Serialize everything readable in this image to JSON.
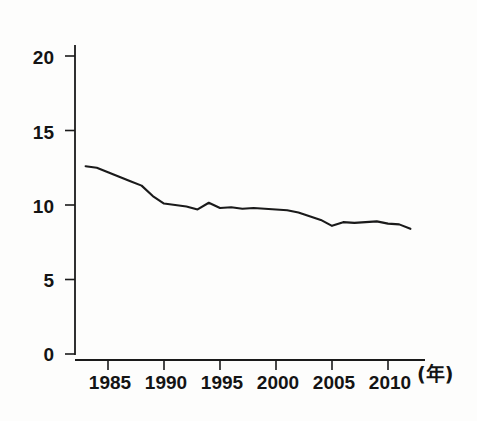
{
  "chart_data": {
    "type": "line",
    "title": "",
    "subtitle": "",
    "xlabel": "(年)",
    "ylabel": "",
    "grid": false,
    "legend": "none",
    "xlim": [
      1983,
      2012
    ],
    "ylim": [
      0,
      20
    ],
    "x_ticks": [
      1985,
      1990,
      1995,
      2000,
      2005,
      2010
    ],
    "x_tick_labels": [
      "1985",
      "1990",
      "1995",
      "2000",
      "2005",
      "2010"
    ],
    "y_ticks": [
      0,
      5,
      10,
      15,
      20
    ],
    "y_tick_labels": [
      "0",
      "5",
      "10",
      "15",
      "20"
    ],
    "line_color": "#1a1a1a",
    "series": [
      {
        "name": "rate",
        "x": [
          1983,
          1984,
          1985,
          1986,
          1987,
          1988,
          1989,
          1990,
          1991,
          1992,
          1993,
          1994,
          1995,
          1996,
          1997,
          1998,
          1999,
          2000,
          2001,
          2002,
          2003,
          2004,
          2005,
          2006,
          2007,
          2008,
          2009,
          2010,
          2011,
          2012
        ],
        "values": [
          12.6,
          12.5,
          12.2,
          11.9,
          11.6,
          11.3,
          10.6,
          10.1,
          10.0,
          9.9,
          9.7,
          10.15,
          9.8,
          9.85,
          9.75,
          9.8,
          9.75,
          9.7,
          9.65,
          9.5,
          9.25,
          9.0,
          8.6,
          8.85,
          8.8,
          8.85,
          8.9,
          8.75,
          8.7,
          8.4
        ]
      }
    ],
    "annotations": []
  },
  "axes": {
    "y_axis_name": "y-axis",
    "x_axis_name": "x-axis",
    "unit_label": "(年)"
  }
}
